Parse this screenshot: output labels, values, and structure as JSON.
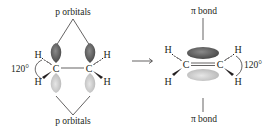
{
  "left": {
    "top_label": "p orbitals",
    "bottom_label": "p orbitals",
    "angle_label": "120°",
    "atoms": {
      "c1": "C",
      "c2": "C",
      "h_top_left": "H",
      "h_bottom_left": "H",
      "h_top_right": "H",
      "h_bottom_right": "H"
    }
  },
  "right": {
    "top_label": "π bond",
    "bottom_label": "π bond",
    "angle_label": "120°",
    "atoms": {
      "c1": "C",
      "c2": "C",
      "h_top_left": "H",
      "h_bottom_left": "H",
      "h_top_right": "H",
      "h_bottom_right": "H"
    }
  },
  "colors": {
    "lobe_dark": "#5a5a5a",
    "lobe_light": "#c8c8c8",
    "ink": "#231f20"
  }
}
